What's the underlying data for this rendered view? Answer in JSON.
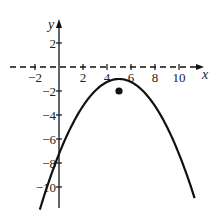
{
  "chart_data": {
    "type": "line",
    "title": "",
    "xlabel": "x",
    "ylabel": "y",
    "xlim": [
      -2.7,
      12.3
    ],
    "ylim": [
      -12.6,
      3.2
    ],
    "x_ticks": [
      -2,
      2,
      4,
      6,
      8,
      10
    ],
    "x_tick_labels": [
      "−2",
      "2",
      "4",
      "6",
      "8",
      "10"
    ],
    "y_ticks": [
      2,
      -2,
      -4,
      -6,
      -8,
      -10
    ],
    "y_tick_labels": [
      "2",
      "−2",
      "−4",
      "−6",
      "−8",
      "−10"
    ],
    "grid": false,
    "x_axis_style": "dashed",
    "series": [
      {
        "name": "parabola",
        "equation": "y = -0.25(x-5)^2 - 1",
        "vertex": [
          5,
          -1
        ],
        "x": [
          -1.6,
          0,
          1,
          2,
          3,
          4,
          5,
          6,
          7,
          8,
          9,
          10,
          11.3
        ],
        "y": [
          -11.9,
          -7.25,
          -5,
          -3.25,
          -2,
          -1.25,
          -1,
          -1.25,
          -2,
          -3.25,
          -5,
          -7.25,
          -10.9
        ]
      }
    ],
    "points": [
      {
        "name": "point",
        "x": 5,
        "y": -2
      }
    ]
  }
}
